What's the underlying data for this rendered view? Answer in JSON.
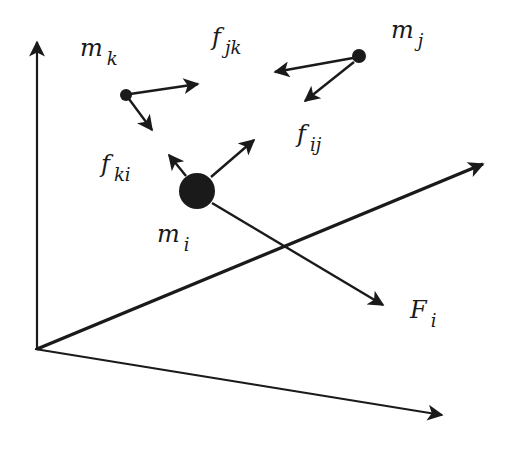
{
  "diagram": {
    "type": "particle-forces-3d",
    "colors": {
      "ink": "#1a1a1a",
      "background": "#ffffff"
    },
    "axes": {
      "origin": [
        37,
        349
      ],
      "vertical_end": [
        37,
        40
      ],
      "diagonal_end": [
        483,
        164
      ],
      "horizontal_end": [
        442,
        415
      ]
    },
    "particles": [
      {
        "id": "m_k",
        "base": "m",
        "sub": "k",
        "pos": [
          126,
          95
        ],
        "r": 6,
        "label_pos": [
          80,
          36
        ]
      },
      {
        "id": "m_j",
        "base": "m",
        "sub": "j",
        "pos": [
          359,
          56
        ],
        "r": 7,
        "label_pos": [
          391,
          18
        ]
      },
      {
        "id": "m_i",
        "base": "m",
        "sub": "i",
        "pos": [
          197,
          191
        ],
        "r": 18,
        "label_pos": [
          157,
          222
        ]
      }
    ],
    "arrows": [
      {
        "id": "mk-to-right",
        "from": [
          130,
          94
        ],
        "to": [
          198,
          84
        ]
      },
      {
        "id": "mk-to-down",
        "from": [
          129,
          99
        ],
        "to": [
          152,
          130
        ]
      },
      {
        "id": "mj-to-left",
        "from": [
          353,
          58
        ],
        "to": [
          275,
          72
        ]
      },
      {
        "id": "mj-to-down",
        "from": [
          354,
          62
        ],
        "to": [
          305,
          101
        ]
      },
      {
        "id": "mi-to-upleft",
        "from": [
          186,
          176
        ],
        "to": [
          169,
          155
        ]
      },
      {
        "id": "mi-to-upright",
        "from": [
          211,
          177
        ],
        "to": [
          254,
          140
        ]
      },
      {
        "id": "mi-net-force",
        "from": [
          212,
          203
        ],
        "to": [
          383,
          305
        ]
      }
    ],
    "labels": {
      "f_jk": {
        "base": "f",
        "sub": "jk",
        "pos": [
          212,
          25
        ]
      },
      "f_ij": {
        "base": "f",
        "sub": "ij",
        "pos": [
          297,
          122
        ]
      },
      "f_ki": {
        "base": "f",
        "sub": "ki",
        "pos": [
          101,
          152
        ]
      },
      "F_i": {
        "base": "F",
        "sub": "i",
        "pos": [
          410,
          298
        ]
      }
    }
  },
  "text": {
    "m_k": {
      "base": "m",
      "sub": "k"
    },
    "m_j": {
      "base": "m",
      "sub": "j"
    },
    "m_i": {
      "base": "m",
      "sub": "i"
    },
    "f_jk": {
      "base": "f",
      "sub": "jk"
    },
    "f_ij": {
      "base": "f",
      "sub": "ij"
    },
    "f_ki": {
      "base": "f",
      "sub": "ki"
    },
    "F_i": {
      "base": "F",
      "sub": "i"
    }
  }
}
